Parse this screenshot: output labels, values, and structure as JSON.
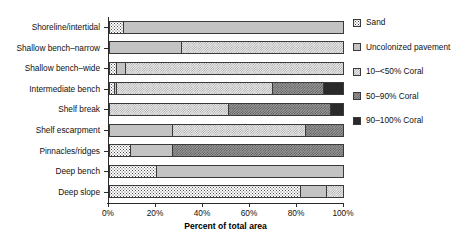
{
  "chart_data": {
    "type": "bar",
    "orientation": "horizontal",
    "stacked": true,
    "title": "",
    "xlabel": "Percent of total area",
    "ylabel": "",
    "xlim": [
      0,
      100
    ],
    "xticks": [
      "0%",
      "20%",
      "40%",
      "60%",
      "80%",
      "100%"
    ],
    "xtick_values": [
      0,
      20,
      40,
      60,
      80,
      100
    ],
    "grid": false,
    "legend_position": "right",
    "categories": [
      "Shoreline/intertidal",
      "Shallow bench–narrow",
      "Shallow bench–wide",
      "Intermediate bench",
      "Shelf break",
      "Shelf escarpment",
      "Pinnacles/ridges",
      "Deep bench",
      "Deep slope"
    ],
    "series": [
      {
        "name": "Sand",
        "key": "sand",
        "color": "#ffffff",
        "pattern": "fine-dots",
        "values": [
          6,
          0,
          3,
          2,
          0,
          0,
          9,
          20,
          82
        ]
      },
      {
        "name": "Uncolonized pavement",
        "key": "uncolonized_pavement",
        "color": "#c3c3c3",
        "pattern": "solid-gray",
        "values": [
          94,
          31,
          4,
          1,
          0,
          27,
          18,
          80,
          11
        ]
      },
      {
        "name": "10–<50% Coral",
        "key": "coral_10_50",
        "color": "#ececec",
        "pattern": "fine-crosshatch",
        "values": [
          0,
          69,
          93,
          67,
          51,
          57,
          0,
          0,
          7
        ]
      },
      {
        "name": "50–90% Coral",
        "key": "coral_50_90",
        "color": "#9a9a9a",
        "pattern": "dense-crosshatch",
        "values": [
          0,
          0,
          0,
          22,
          44,
          16,
          73,
          0,
          0
        ]
      },
      {
        "name": "90–100% Coral",
        "key": "coral_90_100",
        "color": "#2a2a2a",
        "pattern": "solid-dark",
        "values": [
          0,
          0,
          0,
          8,
          5,
          0,
          0,
          0,
          0
        ]
      }
    ],
    "stacks": [
      {
        "category": "Shoreline/intertidal",
        "segments": [
          {
            "key": "sand",
            "value": 6
          },
          {
            "key": "uncolonized_pavement",
            "value": 94
          }
        ]
      },
      {
        "category": "Shallow bench–narrow",
        "segments": [
          {
            "key": "uncolonized_pavement",
            "value": 31
          },
          {
            "key": "coral_10_50",
            "value": 69
          }
        ]
      },
      {
        "category": "Shallow bench–wide",
        "segments": [
          {
            "key": "sand",
            "value": 3
          },
          {
            "key": "uncolonized_pavement",
            "value": 4
          },
          {
            "key": "coral_10_50",
            "value": 93
          }
        ]
      },
      {
        "category": "Intermediate bench",
        "segments": [
          {
            "key": "sand",
            "value": 2
          },
          {
            "key": "uncolonized_pavement",
            "value": 1
          },
          {
            "key": "coral_10_50",
            "value": 67
          },
          {
            "key": "coral_50_90",
            "value": 22
          },
          {
            "key": "coral_90_100",
            "value": 8
          }
        ]
      },
      {
        "category": "Shelf break",
        "segments": [
          {
            "key": "coral_10_50",
            "value": 51
          },
          {
            "key": "coral_50_90",
            "value": 44
          },
          {
            "key": "coral_90_100",
            "value": 5
          }
        ]
      },
      {
        "category": "Shelf escarpment",
        "segments": [
          {
            "key": "uncolonized_pavement",
            "value": 27
          },
          {
            "key": "coral_10_50",
            "value": 57
          },
          {
            "key": "coral_50_90",
            "value": 16
          }
        ]
      },
      {
        "category": "Pinnacles/ridges",
        "segments": [
          {
            "key": "sand",
            "value": 9
          },
          {
            "key": "uncolonized_pavement",
            "value": 18
          },
          {
            "key": "coral_50_90",
            "value": 73
          }
        ]
      },
      {
        "category": "Deep bench",
        "segments": [
          {
            "key": "sand",
            "value": 20
          },
          {
            "key": "uncolonized_pavement",
            "value": 80
          }
        ]
      },
      {
        "category": "Deep slope",
        "segments": [
          {
            "key": "sand",
            "value": 82
          },
          {
            "key": "uncolonized_pavement",
            "value": 11
          },
          {
            "key": "coral_10_50",
            "value": 7
          }
        ]
      }
    ]
  },
  "axis": {
    "x_title": "Percent of total area"
  },
  "legend": {
    "items": [
      {
        "label": "Sand",
        "key": "sand"
      },
      {
        "label": "Uncolonized pavement",
        "key": "uncolonized_pavement"
      },
      {
        "label": "10–<50% Coral",
        "key": "coral_10_50"
      },
      {
        "label": "50–90% Coral",
        "key": "coral_50_90"
      },
      {
        "label": "90–100% Coral",
        "key": "coral_90_100"
      }
    ]
  }
}
